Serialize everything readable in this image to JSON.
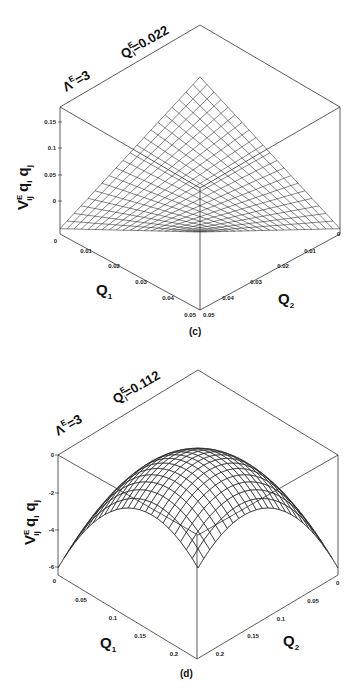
{
  "chart_data": [
    {
      "panel": "(c)",
      "type": "surface3d",
      "title": "",
      "annotations": [
        "Λ^E=3",
        "Q^E_i=0.022"
      ],
      "xlabel": "Q1",
      "ylabel": "Q2",
      "zlabel": "V^E_ij q_i q_j",
      "x_ticks": [
        "0",
        "0.01",
        "0.02",
        "0.03",
        "0.04",
        "0.05"
      ],
      "y_ticks": [
        "0",
        "0.01",
        "0.02",
        "0.03",
        "0.04",
        "0.05"
      ],
      "z_ticks": [
        "0",
        "0.05",
        "0.1",
        "0.15"
      ],
      "xlim": [
        0,
        0.05
      ],
      "ylim": [
        0,
        0.05
      ],
      "zlim": [
        -0.03,
        0.17
      ],
      "surface_description": "Saddle-like surface: maximum ~0.15 at Q1=Q2=0.05 corner (rendered as top peak), near -0.02 minimum along edges Q1=0 / Q2=0",
      "grid": false
    },
    {
      "panel": "(d)",
      "type": "surface3d",
      "title": "",
      "annotations": [
        "Λ^E=3",
        "Q^E_i=0.112"
      ],
      "xlabel": "Q1",
      "ylabel": "Q2",
      "zlabel": "V^E_ij q_i q_j",
      "x_ticks": [
        "0",
        "0.05",
        "0.1",
        "0.15",
        "0.2"
      ],
      "y_ticks": [
        "0",
        "0.05",
        "0.1",
        "0.15",
        "0.2"
      ],
      "z_ticks": [
        "-6",
        "-4",
        "-2",
        "0"
      ],
      "xlim": [
        0,
        0.22
      ],
      "ylim": [
        0,
        0.22
      ],
      "zlim": [
        -6.5,
        0
      ],
      "surface_description": "Dome-shaped concave surface: maximum ~0 near Q1=Q2=0.112, falling to ~-6 at the corners",
      "grid": false
    }
  ],
  "panels": {
    "c": {
      "label": "(c)",
      "lambda": "Λ",
      "lambda_sup": "E",
      "lambda_val": "=3",
      "q": "Q",
      "q_sup": "E",
      "q_sub": "i",
      "q_val": "=0.022",
      "zlabel_main": "V",
      "zlabel_sup": "E",
      "zlabel_sub": "ij",
      "zlabel_rest": " q",
      "zlabel_i": "i",
      "zlabel_q2": " q",
      "zlabel_j": "j",
      "xlabel": "Q",
      "xlabel_sub": "1",
      "ylabel": "Q",
      "ylabel_sub": "2",
      "z_ticks": [
        "0.15",
        "0.1",
        "0.05",
        "0"
      ],
      "x_ticks": [
        "0",
        "0.01",
        "0.02",
        "0.03",
        "0.04",
        "0.05"
      ],
      "y_ticks": [
        "0",
        "0.01",
        "0.02",
        "0.03",
        "0.04",
        "0.05"
      ]
    },
    "d": {
      "label": "(d)",
      "lambda": "Λ",
      "lambda_sup": "E",
      "lambda_val": "=3",
      "q": "Q",
      "q_sup": "E",
      "q_sub": "i",
      "q_val": "=0.112",
      "zlabel_main": "V",
      "zlabel_sup": "E",
      "zlabel_sub": "ij",
      "zlabel_rest": " q",
      "zlabel_i": "i",
      "zlabel_q2": " q",
      "zlabel_j": "j",
      "xlabel": "Q",
      "xlabel_sub": "1",
      "ylabel": "Q",
      "ylabel_sub": "2",
      "z_ticks": [
        "0",
        "-2",
        "-4",
        "-6"
      ],
      "x_ticks": [
        "0",
        "0.05",
        "0.1",
        "0.15",
        "0.2"
      ],
      "y_ticks": [
        "0",
        "0.05",
        "0.1",
        "0.15",
        "0.2"
      ]
    }
  }
}
